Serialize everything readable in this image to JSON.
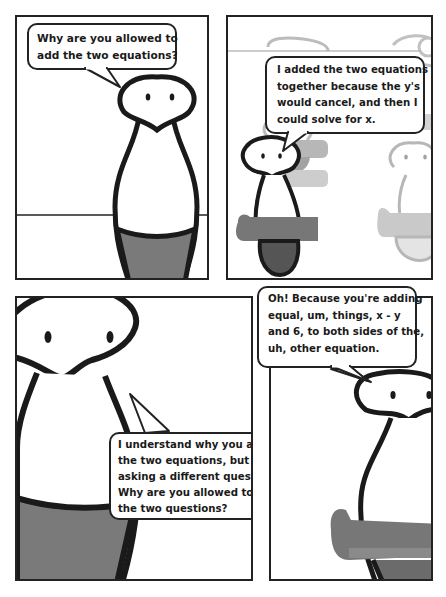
{
  "comic": {
    "panels": [
      {
        "id": 1,
        "speaker": "teacher",
        "bubble": {
          "lines": [
            "Why are you allowed to",
            "add the two equations?"
          ]
        }
      },
      {
        "id": 2,
        "speaker": "student",
        "bubble": {
          "lines": [
            "I added the two equations",
            "together because the y's",
            "would cancel, and then I",
            "could solve for x."
          ]
        }
      },
      {
        "id": 3,
        "speaker": "teacher",
        "bubble": {
          "lines": [
            "I understand why you added",
            "the two equations, but I'm",
            "asking a different question.",
            "Why are you allowed to add",
            "the two questions?"
          ]
        }
      },
      {
        "id": 4,
        "speaker": "student",
        "bubble": {
          "lines": [
            "Oh! Because you're adding",
            "equal, um, things, x - y",
            "and 6, to both sides of the,",
            "uh, other equation."
          ]
        }
      }
    ]
  },
  "colors": {
    "ink": "#1a1a1a",
    "paper": "#ffffff",
    "body_fill_dark": "#7a7a7a",
    "desk_fill": "#6e6e6e",
    "faded_ink": "#a8a8a8",
    "faded_fill": "#c9c9c9"
  }
}
